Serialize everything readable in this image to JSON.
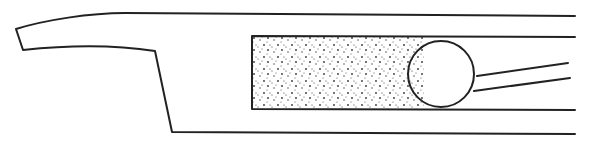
{
  "figure": {
    "kind": "line-drawing",
    "colors": {
      "stroke": "#222222",
      "background": "#ffffff",
      "stipple": "#333333"
    },
    "elements": {
      "housing": "outer-body",
      "insert": "stippled-insert",
      "ball": "circle",
      "leads": [
        "upper-line",
        "lower-line"
      ]
    },
    "labels": []
  }
}
